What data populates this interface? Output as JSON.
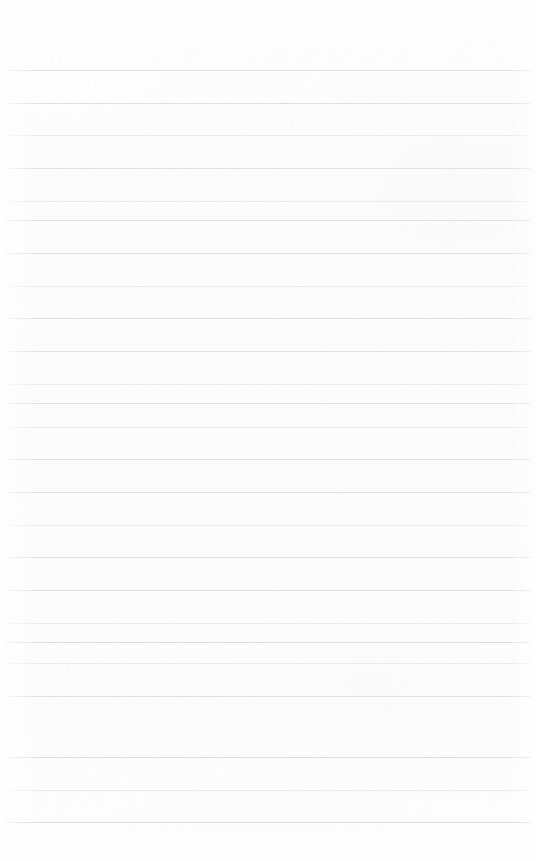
{
  "document": {
    "kind": "blank-ruled-notepad-page",
    "title": "Blank Ruled Notepad Page",
    "body_text": "",
    "has_text_content": false,
    "has_margin_rule": false,
    "has_header": false,
    "has_footer": false,
    "has_page_number": false
  },
  "page": {
    "width": 536,
    "height": 861,
    "background_color": "#fdfdfd",
    "edge_tint_color": "#fefefe"
  },
  "ruling": {
    "line_color": "#d9dde0",
    "line_color_faint": "#e3e7ea",
    "line_color_strong": "#d2d7db",
    "line_thickness": 1,
    "line_left": 5,
    "line_right": 531,
    "line_width": 526,
    "first_line_y": 70,
    "last_line_y": 822,
    "line_spacing": 32.7,
    "line_count": 24,
    "top_margin": 70,
    "bottom_margin": 39,
    "lines": [
      {
        "index": 1,
        "y": 70,
        "weight": "normal"
      },
      {
        "index": 2,
        "y": 103,
        "weight": "normal"
      },
      {
        "index": 3,
        "y": 135,
        "weight": "faint"
      },
      {
        "index": 4,
        "y": 168,
        "weight": "normal"
      },
      {
        "index": 5,
        "y": 201,
        "weight": "faint"
      },
      {
        "index": 6,
        "y": 220,
        "weight": "normal"
      },
      {
        "index": 7,
        "y": 253,
        "weight": "normal"
      },
      {
        "index": 8,
        "y": 286,
        "weight": "faint"
      },
      {
        "index": 9,
        "y": 318,
        "weight": "normal"
      },
      {
        "index": 10,
        "y": 351,
        "weight": "normal"
      },
      {
        "index": 11,
        "y": 384,
        "weight": "faint"
      },
      {
        "index": 12,
        "y": 403,
        "weight": "normal"
      },
      {
        "index": 13,
        "y": 427,
        "weight": "faint"
      },
      {
        "index": 14,
        "y": 459,
        "weight": "normal"
      },
      {
        "index": 15,
        "y": 492,
        "weight": "normal"
      },
      {
        "index": 16,
        "y": 525,
        "weight": "faint"
      },
      {
        "index": 17,
        "y": 557,
        "weight": "normal"
      },
      {
        "index": 18,
        "y": 590,
        "weight": "normal"
      },
      {
        "index": 19,
        "y": 623,
        "weight": "faint"
      },
      {
        "index": 20,
        "y": 642,
        "weight": "normal"
      },
      {
        "index": 21,
        "y": 663,
        "weight": "faint"
      },
      {
        "index": 22,
        "y": 696,
        "weight": "normal"
      },
      {
        "index": 23,
        "y": 757,
        "weight": "normal"
      },
      {
        "index": 24,
        "y": 790,
        "weight": "faint"
      },
      {
        "index": 25,
        "y": 822,
        "weight": "strong"
      }
    ]
  }
}
